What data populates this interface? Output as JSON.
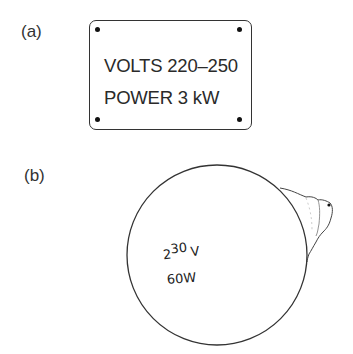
{
  "figure": {
    "panel_a": {
      "label": "(a)",
      "rating_plate": {
        "line1": "VOLTS 220–250",
        "line2": "POWER 3 kW"
      }
    },
    "panel_b": {
      "label": "(b)",
      "bulb": {
        "voltage_marking": "230V",
        "voltage_digits": "2",
        "voltage_digits_raised": "30",
        "voltage_unit": "V",
        "power_marking": "60W"
      }
    }
  }
}
